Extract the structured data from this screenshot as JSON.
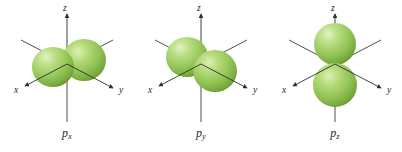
{
  "figure": {
    "background_color": "#ffffff",
    "panel_count": 3
  },
  "style": {
    "lobe_color_mid": "#9BC85A",
    "lobe_color_light": "#CBE49A",
    "lobe_color_dark": "#6E9B36",
    "lobe_rim_color": "#5F8A2C",
    "axis_color": "#3a3a3a",
    "label_color": "#2b2b2b"
  },
  "panels": [
    {
      "id": "p-x",
      "label_base": "p",
      "label_sub": "x",
      "orbital_type": "p",
      "orientation": "x",
      "lobes": 2,
      "axes": [
        {
          "name": "x",
          "letter": "x",
          "direction": "down-left",
          "arrowhead": true
        },
        {
          "name": "y",
          "letter": "y",
          "direction": "down-right",
          "arrowhead": true
        },
        {
          "name": "z",
          "letter": "z",
          "direction": "up",
          "arrowhead": true
        }
      ]
    },
    {
      "id": "p-y",
      "label_base": "p",
      "label_sub": "y",
      "orbital_type": "p",
      "orientation": "y",
      "lobes": 2,
      "axes": [
        {
          "name": "x",
          "letter": "x",
          "direction": "down-left",
          "arrowhead": true
        },
        {
          "name": "y",
          "letter": "y",
          "direction": "down-right",
          "arrowhead": true
        },
        {
          "name": "z",
          "letter": "z",
          "direction": "up",
          "arrowhead": true
        }
      ]
    },
    {
      "id": "p-z",
      "label_base": "p",
      "label_sub": "z",
      "orbital_type": "p",
      "orientation": "z",
      "lobes": 2,
      "axes": [
        {
          "name": "x",
          "letter": "x",
          "direction": "down-left",
          "arrowhead": true
        },
        {
          "name": "y",
          "letter": "y",
          "direction": "down-right",
          "arrowhead": true
        },
        {
          "name": "z",
          "letter": "z",
          "direction": "up",
          "arrowhead": true
        }
      ]
    }
  ]
}
